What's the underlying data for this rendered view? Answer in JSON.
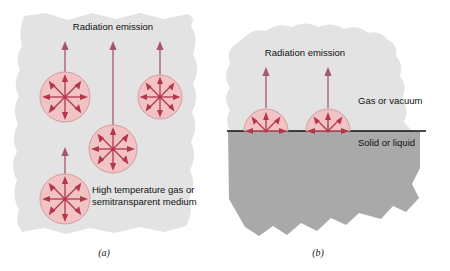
{
  "figure": {
    "width": 450,
    "height": 271,
    "background_color": "#ffffff"
  },
  "colors": {
    "blob_light_gray": "#e3e3e3",
    "solid_gray": "#a9a9a9",
    "sphere_fill": "#f2c3c5",
    "sphere_edge": "#d99a9e",
    "arrow_red": "#b1374a",
    "escape_arrow": "#a8566a",
    "interface_line": "#111111",
    "text_color": "#111111"
  },
  "panel_a": {
    "caption": "(a)",
    "emission_label": "Radiation emission",
    "medium_label_line1": "High temperature gas or",
    "medium_label_line2": "semitransparent medium",
    "emitters": [
      {
        "name": "emitter-upper-left",
        "cx": 65,
        "cy": 97,
        "r": 25,
        "ray_count": 8,
        "escape_arrow_top": 42
      },
      {
        "name": "emitter-upper-right",
        "cx": 160,
        "cy": 97,
        "r": 22,
        "ray_count": 8,
        "escape_arrow_top": 42
      },
      {
        "name": "emitter-center",
        "cx": 113,
        "cy": 149,
        "r": 24,
        "ray_count": 8,
        "escape_arrow_top": 42
      },
      {
        "name": "emitter-lower-left",
        "cx": 65,
        "cy": 199,
        "r": 25,
        "ray_count": 8,
        "escape_arrow_top": 148
      }
    ]
  },
  "panel_b": {
    "caption": "(b)",
    "emission_label": "Radiation emission",
    "gas_label": "Gas or vacuum",
    "solid_label": "Solid or liquid",
    "interface_y": 131,
    "emitters": [
      {
        "name": "surface-emitter-left",
        "cx": 266,
        "cy": 131,
        "r": 22,
        "ray_count": 5,
        "escape_arrow_top": 68
      },
      {
        "name": "surface-emitter-right",
        "cx": 328,
        "cy": 131,
        "r": 22,
        "ray_count": 5,
        "escape_arrow_top": 68
      }
    ]
  }
}
